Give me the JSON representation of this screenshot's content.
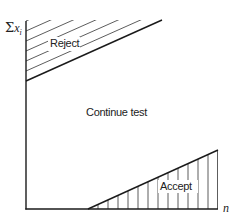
{
  "diagram": {
    "type": "sequential-test-regions",
    "y_axis": {
      "symbol": "Σ",
      "variable": "x",
      "subscript": "i"
    },
    "x_axis": {
      "label": "n"
    },
    "regions": {
      "reject": {
        "label": "Reject",
        "hatch": "diagonal"
      },
      "continue": {
        "label": "Continue test"
      },
      "accept": {
        "label": "Accept",
        "hatch": "vertical"
      }
    },
    "colors": {
      "line": "#1a1a1a",
      "hatch": "#333333",
      "background": "#ffffff"
    }
  }
}
